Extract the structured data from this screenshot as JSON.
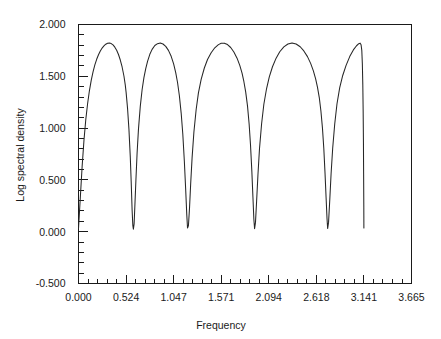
{
  "chart_data": {
    "type": "line",
    "title": "",
    "xlabel": "Frequency",
    "ylabel": "Log spectral density",
    "xlim": [
      0.0,
      3.665
    ],
    "ylim": [
      -0.5,
      2.0
    ],
    "grid": false,
    "legend": null,
    "x_ticks": [
      {
        "value": 0.0,
        "label": "0.000"
      },
      {
        "value": 0.524,
        "label": "0.524"
      },
      {
        "value": 1.047,
        "label": "1.047"
      },
      {
        "value": 1.571,
        "label": "1.571"
      },
      {
        "value": 2.094,
        "label": "2.094"
      },
      {
        "value": 2.618,
        "label": "2.618"
      },
      {
        "value": 3.141,
        "label": "3.141"
      },
      {
        "value": 3.665,
        "label": "3.665"
      }
    ],
    "y_ticks": [
      {
        "value": 2.0,
        "label": "2.000"
      },
      {
        "value": 1.5,
        "label": "1.500"
      },
      {
        "value": 1.0,
        "label": "1.000"
      },
      {
        "value": 0.5,
        "label": "0.500"
      },
      {
        "value": 0.0,
        "label": "0.000"
      },
      {
        "value": -0.5,
        "label": "-0.500"
      }
    ],
    "x_minor_per_major": 5,
    "y_minor_per_major": 5,
    "series": [
      {
        "name": "log spectral density",
        "color": "#262626",
        "x_domain": [
          0.0,
          3.141
        ],
        "n_lobes": 6,
        "peak_value": 1.82,
        "trough_value": 0.03,
        "description": "Six symmetric lobes of a seasonal spectral density over 0 to pi; nulls at multiples of pi/6 excluding endpoints.",
        "points": [
          [
            0.0,
            0.03
          ],
          [
            0.02,
            0.33
          ],
          [
            0.04,
            0.63
          ],
          [
            0.06,
            0.88
          ],
          [
            0.08,
            1.08
          ],
          [
            0.1,
            1.235
          ],
          [
            0.12,
            1.36
          ],
          [
            0.14,
            1.46
          ],
          [
            0.16,
            1.543
          ],
          [
            0.18,
            1.61
          ],
          [
            0.2,
            1.664
          ],
          [
            0.22,
            1.708
          ],
          [
            0.24,
            1.744
          ],
          [
            0.262,
            1.775
          ],
          [
            0.28,
            1.794
          ],
          [
            0.3,
            1.81
          ],
          [
            0.32,
            1.819
          ],
          [
            0.34,
            1.821
          ],
          [
            0.36,
            1.816
          ],
          [
            0.38,
            1.803
          ],
          [
            0.4,
            1.781
          ],
          [
            0.42,
            1.751
          ],
          [
            0.44,
            1.71
          ],
          [
            0.46,
            1.657
          ],
          [
            0.48,
            1.59
          ],
          [
            0.5,
            1.503
          ],
          [
            0.515,
            1.415
          ],
          [
            0.524,
            1.345
          ],
          [
            0.54,
            1.19
          ],
          [
            0.555,
            0.99
          ],
          [
            0.57,
            0.72
          ],
          [
            0.58,
            0.48
          ],
          [
            0.59,
            0.21
          ],
          [
            0.598,
            0.06
          ],
          [
            0.604,
            0.025
          ],
          [
            0.612,
            0.075
          ],
          [
            0.62,
            0.24
          ],
          [
            0.632,
            0.5
          ],
          [
            0.645,
            0.76
          ],
          [
            0.66,
            0.99
          ],
          [
            0.68,
            1.21
          ],
          [
            0.7,
            1.37
          ],
          [
            0.72,
            1.487
          ],
          [
            0.74,
            1.575
          ],
          [
            0.76,
            1.644
          ],
          [
            0.785,
            1.712
          ],
          [
            0.81,
            1.76
          ],
          [
            0.84,
            1.797
          ],
          [
            0.87,
            1.815
          ],
          [
            0.9,
            1.821
          ],
          [
            0.93,
            1.812
          ],
          [
            0.96,
            1.789
          ],
          [
            0.99,
            1.75
          ],
          [
            1.02,
            1.693
          ],
          [
            1.047,
            1.62
          ],
          [
            1.07,
            1.535
          ],
          [
            1.09,
            1.44
          ],
          [
            1.11,
            1.315
          ],
          [
            1.13,
            1.145
          ],
          [
            1.148,
            0.94
          ],
          [
            1.165,
            0.68
          ],
          [
            1.18,
            0.4
          ],
          [
            1.192,
            0.16
          ],
          [
            1.2,
            0.035
          ],
          [
            1.21,
            0.06
          ],
          [
            1.222,
            0.23
          ],
          [
            1.235,
            0.47
          ],
          [
            1.25,
            0.71
          ],
          [
            1.27,
            0.96
          ],
          [
            1.295,
            1.18
          ],
          [
            1.32,
            1.34
          ],
          [
            1.35,
            1.47
          ],
          [
            1.385,
            1.58
          ],
          [
            1.42,
            1.662
          ],
          [
            1.46,
            1.727
          ],
          [
            1.5,
            1.775
          ],
          [
            1.54,
            1.806
          ],
          [
            1.571,
            1.819
          ],
          [
            1.605,
            1.82
          ],
          [
            1.64,
            1.806
          ],
          [
            1.675,
            1.778
          ],
          [
            1.71,
            1.735
          ],
          [
            1.745,
            1.675
          ],
          [
            1.775,
            1.605
          ],
          [
            1.8,
            1.53
          ],
          [
            1.82,
            1.45
          ],
          [
            1.84,
            1.35
          ],
          [
            1.86,
            1.215
          ],
          [
            1.878,
            1.04
          ],
          [
            1.893,
            0.84
          ],
          [
            1.908,
            0.58
          ],
          [
            1.92,
            0.33
          ],
          [
            1.93,
            0.12
          ],
          [
            1.938,
            0.028
          ],
          [
            1.948,
            0.09
          ],
          [
            1.96,
            0.29
          ],
          [
            1.975,
            0.55
          ],
          [
            1.992,
            0.8
          ],
          [
            2.015,
            1.04
          ],
          [
            2.04,
            1.23
          ],
          [
            2.07,
            1.382
          ],
          [
            2.1,
            1.495
          ],
          [
            2.135,
            1.592
          ],
          [
            2.175,
            1.675
          ],
          [
            2.215,
            1.737
          ],
          [
            2.26,
            1.784
          ],
          [
            2.305,
            1.812
          ],
          [
            2.35,
            1.821
          ],
          [
            2.395,
            1.812
          ],
          [
            2.44,
            1.785
          ],
          [
            2.48,
            1.745
          ],
          [
            2.52,
            1.69
          ],
          [
            2.555,
            1.625
          ],
          [
            2.585,
            1.553
          ],
          [
            2.61,
            1.475
          ],
          [
            2.63,
            1.395
          ],
          [
            2.65,
            1.295
          ],
          [
            2.668,
            1.165
          ],
          [
            2.685,
            1.0
          ],
          [
            2.7,
            0.8
          ],
          [
            2.713,
            0.57
          ],
          [
            2.725,
            0.33
          ],
          [
            2.735,
            0.13
          ],
          [
            2.742,
            0.03
          ],
          [
            2.752,
            0.09
          ],
          [
            2.765,
            0.3
          ],
          [
            2.78,
            0.56
          ],
          [
            2.798,
            0.81
          ],
          [
            2.82,
            1.04
          ],
          [
            2.845,
            1.235
          ],
          [
            2.875,
            1.39
          ],
          [
            2.908,
            1.508
          ],
          [
            2.945,
            1.605
          ],
          [
            2.985,
            1.69
          ],
          [
            3.025,
            1.755
          ],
          [
            3.06,
            1.795
          ],
          [
            3.085,
            1.815
          ],
          [
            3.1,
            1.82
          ],
          [
            3.11,
            1.805
          ],
          [
            3.118,
            1.75
          ],
          [
            3.124,
            1.62
          ],
          [
            3.129,
            1.42
          ],
          [
            3.133,
            1.16
          ],
          [
            3.136,
            0.86
          ],
          [
            3.138,
            0.56
          ],
          [
            3.14,
            0.26
          ],
          [
            3.141,
            0.035
          ]
        ]
      }
    ]
  }
}
